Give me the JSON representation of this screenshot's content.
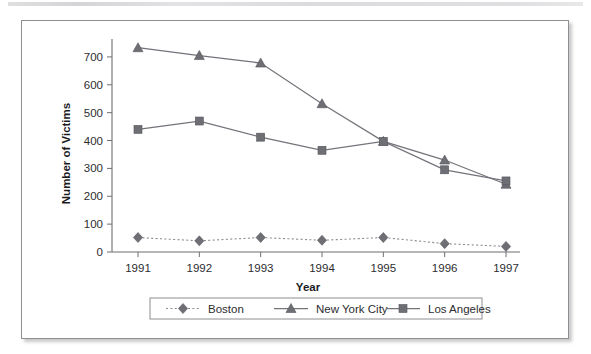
{
  "chart_data": {
    "type": "line",
    "title": "",
    "xlabel": "Year",
    "ylabel": "Number of Victims",
    "categories": [
      "1991",
      "1992",
      "1993",
      "1994",
      "1995",
      "1996",
      "1997"
    ],
    "x": [
      1991,
      1992,
      1993,
      1994,
      1995,
      1996,
      1997
    ],
    "ylim": [
      0,
      750
    ],
    "yticks": [
      0,
      100,
      200,
      300,
      400,
      500,
      600,
      700
    ],
    "ytick_labels": [
      "0",
      "100",
      "200",
      "300",
      "400",
      "500",
      "600",
      "700"
    ],
    "grid": false,
    "legend_position": "bottom",
    "series": [
      {
        "name": "Boston",
        "marker": "diamond",
        "line_style": "dotted",
        "color": "#8a8a90",
        "values": [
          52,
          40,
          52,
          42,
          52,
          30,
          20
        ]
      },
      {
        "name": "New York City",
        "marker": "triangle",
        "line_style": "solid",
        "color": "#73737a",
        "values": [
          733,
          705,
          678,
          532,
          397,
          330,
          243
        ]
      },
      {
        "name": "Los Angeles",
        "marker": "square",
        "line_style": "solid",
        "color": "#73737a",
        "values": [
          440,
          470,
          412,
          365,
          397,
          295,
          255
        ]
      }
    ]
  },
  "legend": {
    "entries": [
      {
        "label": "Boston"
      },
      {
        "label": "New York City"
      },
      {
        "label": "Los Angeles"
      }
    ]
  },
  "axes": {
    "x_title": "Year",
    "y_title": "Number of Victims"
  },
  "colors": {
    "frame_border": "#8e8e93",
    "axis": "#6f6f74",
    "series_gray": "#73737a",
    "dotted_gray": "#8a8a90",
    "text": "#2d2d30",
    "page_background": "#ffffff"
  }
}
